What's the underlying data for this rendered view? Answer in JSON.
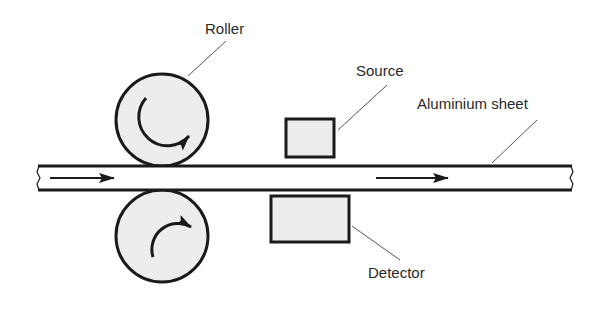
{
  "diagram": {
    "labels": {
      "roller": "Roller",
      "source": "Source",
      "sheet": "Aluminium sheet",
      "detector": "Detector"
    },
    "components": [
      {
        "id": "top-roller",
        "type": "circle",
        "rotation": "clockwise"
      },
      {
        "id": "bottom-roller",
        "type": "circle",
        "rotation": "clockwise"
      },
      {
        "id": "aluminium-sheet",
        "type": "strip",
        "direction": "left-to-right"
      },
      {
        "id": "source",
        "type": "box",
        "position": "above sheet"
      },
      {
        "id": "detector",
        "type": "box",
        "position": "below sheet"
      }
    ],
    "colors": {
      "stroke": "#1a1a1a",
      "fill": "#ededed",
      "leader": "#555555",
      "text": "#2a2a2a"
    }
  }
}
